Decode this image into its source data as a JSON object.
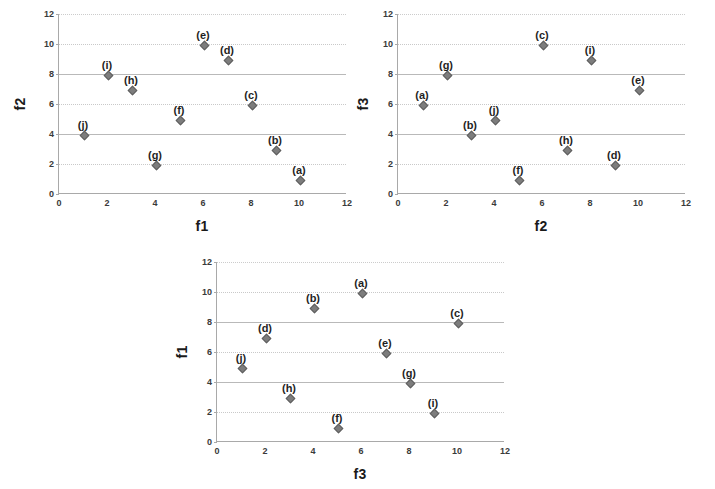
{
  "figure": {
    "background": "#ffffff",
    "marker_color": "#7d7d7d",
    "grid_color": "#b9b9b9",
    "axis_color": "#a9a9a9"
  },
  "chart_data": [
    {
      "type": "scatter",
      "id": "f2-vs-f1",
      "title": "",
      "xlabel": "f1",
      "ylabel": "f2",
      "xlim": [
        0,
        12
      ],
      "ylim": [
        0,
        12
      ],
      "xticks": [
        0,
        2,
        4,
        6,
        8,
        10,
        12
      ],
      "yticks": [
        0,
        2,
        4,
        6,
        8,
        10,
        12
      ],
      "grid": true,
      "legend": "none",
      "points": [
        {
          "label": "(a)",
          "x": 10,
          "y": 1
        },
        {
          "label": "(b)",
          "x": 9,
          "y": 3
        },
        {
          "label": "(c)",
          "x": 8,
          "y": 6
        },
        {
          "label": "(d)",
          "x": 7,
          "y": 9
        },
        {
          "label": "(e)",
          "x": 6,
          "y": 10
        },
        {
          "label": "(f)",
          "x": 5,
          "y": 5
        },
        {
          "label": "(g)",
          "x": 4,
          "y": 2
        },
        {
          "label": "(h)",
          "x": 3,
          "y": 7
        },
        {
          "label": "(i)",
          "x": 2,
          "y": 8
        },
        {
          "label": "(j)",
          "x": 1,
          "y": 4
        }
      ]
    },
    {
      "type": "scatter",
      "id": "f3-vs-f2",
      "title": "",
      "xlabel": "f2",
      "ylabel": "f3",
      "xlim": [
        0,
        12
      ],
      "ylim": [
        0,
        12
      ],
      "xticks": [
        0,
        2,
        4,
        6,
        8,
        10,
        12
      ],
      "yticks": [
        0,
        2,
        4,
        6,
        8,
        10,
        12
      ],
      "grid": true,
      "legend": "none",
      "points": [
        {
          "label": "(a)",
          "x": 1,
          "y": 6
        },
        {
          "label": "(b)",
          "x": 3,
          "y": 4
        },
        {
          "label": "(c)",
          "x": 6,
          "y": 10
        },
        {
          "label": "(d)",
          "x": 9,
          "y": 2
        },
        {
          "label": "(e)",
          "x": 10,
          "y": 7
        },
        {
          "label": "(f)",
          "x": 5,
          "y": 1
        },
        {
          "label": "(g)",
          "x": 2,
          "y": 8
        },
        {
          "label": "(h)",
          "x": 7,
          "y": 3
        },
        {
          "label": "(i)",
          "x": 8,
          "y": 9
        },
        {
          "label": "(j)",
          "x": 4,
          "y": 5
        }
      ]
    },
    {
      "type": "scatter",
      "id": "f1-vs-f3",
      "title": "",
      "xlabel": "f3",
      "ylabel": "f1",
      "xlim": [
        0,
        12
      ],
      "ylim": [
        0,
        12
      ],
      "xticks": [
        0,
        2,
        4,
        6,
        8,
        10,
        12
      ],
      "yticks": [
        0,
        2,
        4,
        6,
        8,
        10,
        12
      ],
      "grid": true,
      "legend": "none",
      "points": [
        {
          "label": "(a)",
          "x": 6,
          "y": 10
        },
        {
          "label": "(b)",
          "x": 4,
          "y": 9
        },
        {
          "label": "(c)",
          "x": 10,
          "y": 8
        },
        {
          "label": "(d)",
          "x": 2,
          "y": 7
        },
        {
          "label": "(e)",
          "x": 7,
          "y": 6
        },
        {
          "label": "(f)",
          "x": 5,
          "y": 1
        },
        {
          "label": "(g)",
          "x": 8,
          "y": 4
        },
        {
          "label": "(h)",
          "x": 3,
          "y": 3
        },
        {
          "label": "(i)",
          "x": 9,
          "y": 2
        },
        {
          "label": "(j)",
          "x": 1,
          "y": 5
        }
      ]
    }
  ]
}
